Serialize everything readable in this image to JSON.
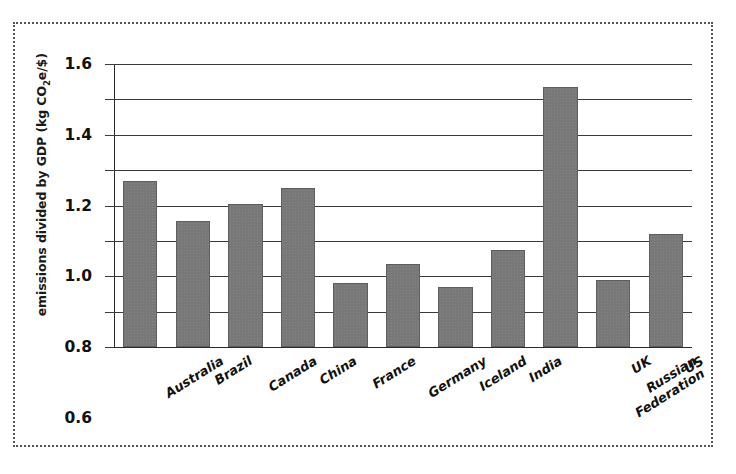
{
  "chart_data": {
    "type": "bar",
    "title": "",
    "subtitle": "",
    "xlabel": "",
    "ylabel": "emissions divided by GDP (kg CO₂e/$)",
    "ylabel_parts": {
      "before": "emissions divided by GDP (kg CO",
      "sub": "2",
      "after": "e/$)"
    },
    "categories": [
      "Australia",
      "Brazil",
      "Canada",
      "China",
      "France",
      "Germany",
      "Iceland",
      "India",
      "Russian Federation",
      "UK",
      "US"
    ],
    "values": [
      0.94,
      0.71,
      0.81,
      0.9,
      0.36,
      0.47,
      0.34,
      0.55,
      1.47,
      0.38,
      0.64
    ],
    "ylim": [
      0,
      1.6
    ],
    "ytick_values": [
      0,
      0.2,
      0.4,
      0.6,
      0.8,
      1.0,
      1.2,
      1.4,
      1.6
    ],
    "ytick_labels": [
      "0",
      "0.2",
      "0.4",
      "0.6",
      "0.8",
      "1.0",
      "1.2",
      "1.4",
      "1.6"
    ],
    "grid": true,
    "grid_axis": "y",
    "legend": null,
    "legend_position": "none",
    "bar_color": "#787878",
    "bar_edge_color": "#5e5e5e",
    "grid_color": "#3a3a3a",
    "axis_color": "#2a2a2a",
    "figure_border_color": "#555555",
    "figure_border_style": "dotted",
    "background_color": "#ffffff",
    "xtick_rotation": -32,
    "annotations": []
  }
}
